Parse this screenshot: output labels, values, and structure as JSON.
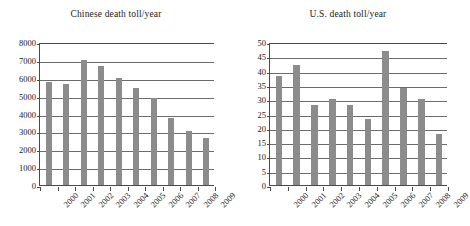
{
  "figure": {
    "background": "#ffffff",
    "bar_color": "#8c8c8c",
    "axis_color": "#4a4a4a",
    "grid_color": "#6b6b6b"
  },
  "chart_data": [
    {
      "type": "bar",
      "title": "Chinese death toll/year",
      "xlabel": "",
      "ylabel": "",
      "categories": [
        "2000",
        "2001",
        "2002",
        "2003",
        "2004",
        "2005",
        "2006",
        "2007",
        "2008",
        "2009"
      ],
      "values": [
        5750,
        5650,
        7000,
        6650,
        6000,
        5450,
        4850,
        3750,
        3000,
        2620
      ],
      "ylim": [
        0,
        8000
      ],
      "ytick_step": 1000,
      "yticks": [
        "0",
        "1000",
        "2000",
        "3000",
        "4000",
        "5000",
        "6000",
        "7000",
        "8000"
      ],
      "grid": "horizontal",
      "legend": "none"
    },
    {
      "type": "bar",
      "title": "U.S. death toll/year",
      "xlabel": "",
      "ylabel": "",
      "categories": [
        "2000",
        "2001",
        "2002",
        "2003",
        "2004",
        "2005",
        "2006",
        "2007",
        "2008",
        "2009"
      ],
      "values": [
        38,
        42,
        28,
        30,
        28,
        23,
        47,
        34,
        30,
        18
      ],
      "ylim": [
        0,
        50
      ],
      "ytick_step": 5,
      "yticks": [
        "0",
        "5",
        "10",
        "15",
        "20",
        "25",
        "30",
        "35",
        "40",
        "45",
        "50"
      ],
      "grid": "horizontal",
      "legend": "none"
    }
  ]
}
